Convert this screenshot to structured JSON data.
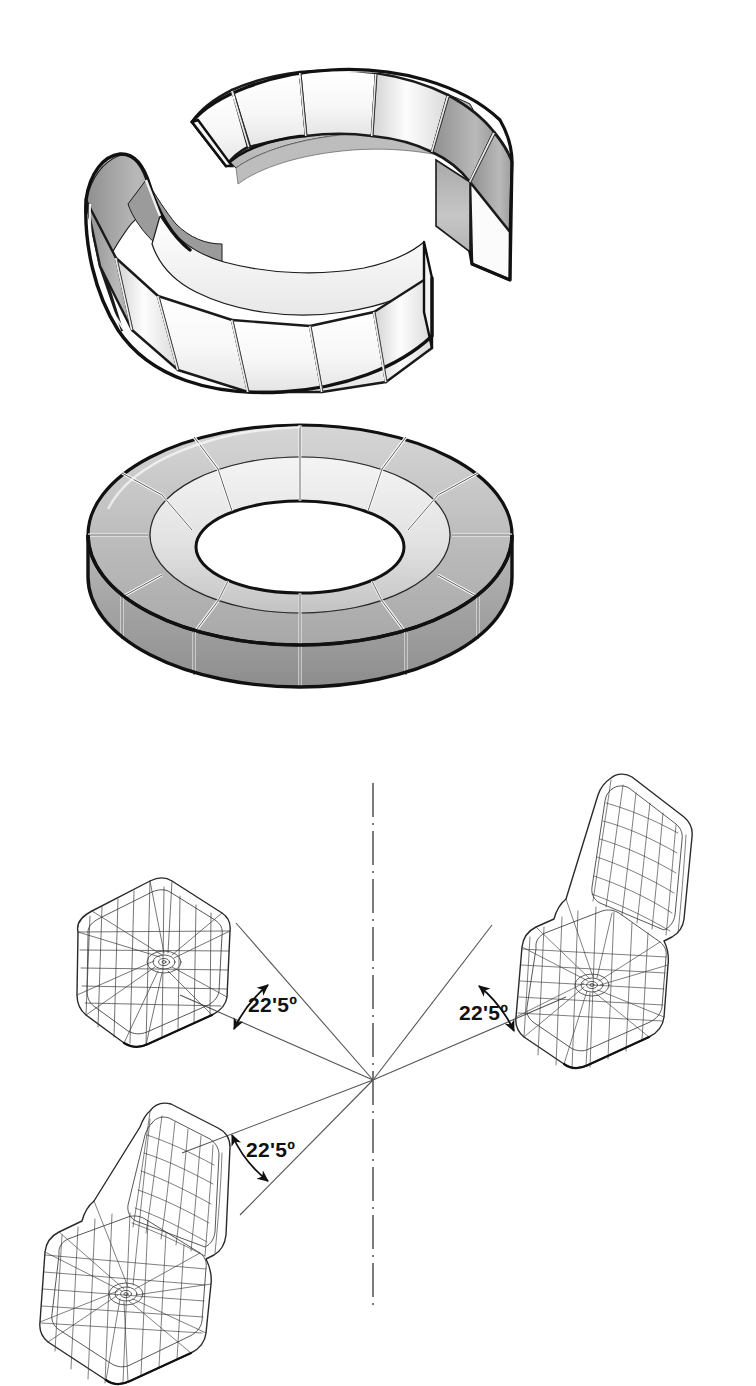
{
  "drawing": {
    "background_color": "#ffffff",
    "line_color": "#1a1a1a",
    "shade_light": "#f2f2f2",
    "shade_mid": "#c9c9c9",
    "shade_dark": "#9a9a9a",
    "wireframe_color": "#3a3a3a"
  },
  "figures": [
    {
      "id": "exploded-arcs",
      "name": "Two half-ring modular seating arcs, exploded isometric view",
      "module_count": 12
    },
    {
      "id": "assembled-ring",
      "name": "Complete assembled circular modular seating ring, isometric view",
      "module_count": 16
    },
    {
      "id": "angle-layout",
      "name": "Three wireframe seat modules arranged radially about a centre point"
    }
  ],
  "angles": {
    "value_text": "22'5º",
    "labels": [
      {
        "id": "angle-upper-left",
        "text": "22'5º"
      },
      {
        "id": "angle-upper-right",
        "text": "22'5º"
      },
      {
        "id": "angle-lower-left",
        "text": "22'5º"
      }
    ]
  },
  "centerline": {
    "name": "vertical-axis-centerline",
    "style": "dash-dot"
  }
}
